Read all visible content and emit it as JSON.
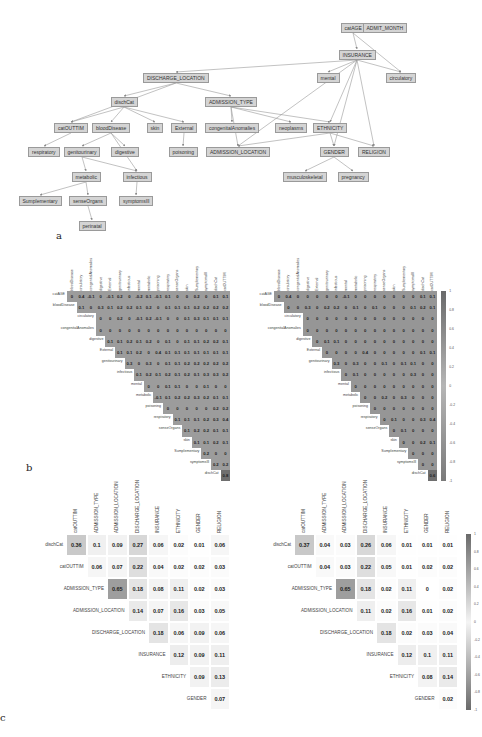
{
  "panels": {
    "a": "a",
    "b": "b",
    "c": "c"
  },
  "graph": {
    "nodes": [
      {
        "id": "catAGE",
        "x": 353,
        "y": 28
      },
      {
        "id": "ADMIT_MONTH",
        "x": 385,
        "y": 28
      },
      {
        "id": "INSURANCE",
        "x": 357,
        "y": 55
      },
      {
        "id": "DISCHARGE_LOCATION",
        "x": 176,
        "y": 78
      },
      {
        "id": "mental",
        "x": 328,
        "y": 78
      },
      {
        "id": "circulatory",
        "x": 401,
        "y": 78
      },
      {
        "id": "dischCat",
        "x": 124,
        "y": 102
      },
      {
        "id": "ADMISSION_TYPE",
        "x": 231,
        "y": 102
      },
      {
        "id": "catOUTTIM",
        "x": 71,
        "y": 128
      },
      {
        "id": "bloodDisease",
        "x": 111,
        "y": 128
      },
      {
        "id": "skin",
        "x": 155,
        "y": 128
      },
      {
        "id": "External",
        "x": 184,
        "y": 128
      },
      {
        "id": "congenitalAnomalies",
        "x": 232,
        "y": 128
      },
      {
        "id": "neoplasms",
        "x": 291,
        "y": 128
      },
      {
        "id": "ETHNICITY",
        "x": 330,
        "y": 128
      },
      {
        "id": "respiratory",
        "x": 44,
        "y": 152
      },
      {
        "id": "genitourinary",
        "x": 82,
        "y": 152
      },
      {
        "id": "digestive",
        "x": 125,
        "y": 152
      },
      {
        "id": "poisoning",
        "x": 183,
        "y": 152
      },
      {
        "id": "ADMISSION_LOCATION",
        "x": 238,
        "y": 152
      },
      {
        "id": "GENDER",
        "x": 334,
        "y": 152
      },
      {
        "id": "RELIGION",
        "x": 374,
        "y": 152
      },
      {
        "id": "metabolic",
        "x": 86,
        "y": 177
      },
      {
        "id": "infectious",
        "x": 137,
        "y": 177
      },
      {
        "id": "musculoskeletal",
        "x": 305,
        "y": 177
      },
      {
        "id": "pregnancy",
        "x": 353,
        "y": 177
      },
      {
        "id": "Sumplementary",
        "x": 40,
        "y": 201
      },
      {
        "id": "senseOrgans",
        "x": 88,
        "y": 201
      },
      {
        "id": "symptomsIll",
        "x": 136,
        "y": 201
      },
      {
        "id": "perinatal",
        "x": 92,
        "y": 226
      }
    ],
    "edges": [
      [
        "catAGE",
        "INSURANCE"
      ],
      [
        "catAGE",
        "circulatory"
      ],
      [
        "INSURANCE",
        "DISCHARGE_LOCATION"
      ],
      [
        "INSURANCE",
        "mental"
      ],
      [
        "INSURANCE",
        "circulatory"
      ],
      [
        "INSURANCE",
        "ETHNICITY"
      ],
      [
        "INSURANCE",
        "GENDER"
      ],
      [
        "INSURANCE",
        "RELIGION"
      ],
      [
        "INSURANCE",
        "ADMISSION_LOCATION"
      ],
      [
        "DISCHARGE_LOCATION",
        "dischCat"
      ],
      [
        "DISCHARGE_LOCATION",
        "ADMISSION_TYPE"
      ],
      [
        "DISCHARGE_LOCATION",
        "catOUTTIM"
      ],
      [
        "dischCat",
        "catOUTTIM"
      ],
      [
        "dischCat",
        "bloodDisease"
      ],
      [
        "dischCat",
        "skin"
      ],
      [
        "dischCat",
        "External"
      ],
      [
        "ADMISSION_TYPE",
        "congenitalAnomalies"
      ],
      [
        "ADMISSION_TYPE",
        "neoplasms"
      ],
      [
        "ADMISSION_TYPE",
        "ETHNICITY"
      ],
      [
        "ADMISSION_TYPE",
        "ADMISSION_LOCATION"
      ],
      [
        "catOUTTIM",
        "respiratory"
      ],
      [
        "bloodDisease",
        "genitourinary"
      ],
      [
        "bloodDisease",
        "digestive"
      ],
      [
        "bloodDisease",
        "infectious"
      ],
      [
        "External",
        "poisoning"
      ],
      [
        "ETHNICITY",
        "ADMISSION_LOCATION"
      ],
      [
        "ETHNICITY",
        "GENDER"
      ],
      [
        "ETHNICITY",
        "RELIGION"
      ],
      [
        "genitourinary",
        "metabolic"
      ],
      [
        "genitourinary",
        "infectious"
      ],
      [
        "metabolic",
        "Sumplementary"
      ],
      [
        "metabolic",
        "senseOrgans"
      ],
      [
        "infectious",
        "symptomsIll"
      ],
      [
        "senseOrgans",
        "perinatal"
      ],
      [
        "GENDER",
        "musculoskeletal"
      ],
      [
        "GENDER",
        "pregnancy"
      ]
    ]
  },
  "chart_data": [
    {
      "type": "heatmap",
      "title": "Panel b (left): correlation matrix of clinical variables",
      "columns": [
        "bloodDisease",
        "circulatory",
        "congenitalAnomalies",
        "digestive",
        "External",
        "genitourinary",
        "infectious",
        "mental",
        "metabolic",
        "poisoning",
        "respiratory",
        "senseOrgans",
        "skin",
        "Sumplementary",
        "symptomsIll",
        "dischCat",
        "catOUTTIM"
      ],
      "rows": [
        {
          "label": "catAGE",
          "values": [
            "0",
            "0.4",
            "-0.1",
            "0",
            "-0.1",
            "0.2",
            "0",
            "-0.2",
            "0.1",
            "-0.1",
            "0.1",
            "0",
            "0",
            "0.2",
            "0",
            "0.1",
            "0.1"
          ]
        },
        {
          "label": "bloodDisease",
          "values": [
            "0.1",
            "0",
            "0.3",
            "0.1",
            "0.2",
            "0.2",
            "0.1",
            "0.2",
            "0",
            "0.1",
            "0.1",
            "0.1",
            "0.2",
            "0.2",
            "0.2",
            "0.2"
          ]
        },
        {
          "label": "circulatory",
          "values": [
            "0",
            "0",
            "0.2",
            "0",
            "-0.1",
            "0.2",
            "-0.1",
            "0",
            "0",
            "0.1",
            "0.3",
            "0.1",
            "0.1",
            "0.1"
          ]
        },
        {
          "label": "congenitalAnomalies",
          "values": [
            "0",
            "0",
            "0",
            "0",
            "0",
            "0",
            "0",
            "0",
            "0",
            "0",
            "0",
            "0",
            "0",
            "0"
          ]
        },
        {
          "label": "digestive",
          "values": [
            "0.1",
            "0.1",
            "0.2",
            "0.1",
            "0.2",
            "0",
            "0.1",
            "0",
            "0.1",
            "0.1",
            "0.2",
            "0.2",
            "0.1"
          ]
        },
        {
          "label": "External",
          "values": [
            "0.1",
            "0.1",
            "0.2",
            "0",
            "0.4",
            "0.1",
            "0.1",
            "0.1",
            "0.1",
            "0.1",
            "0.1",
            "0.1"
          ]
        },
        {
          "label": "genitourinary",
          "values": [
            "0.3",
            "0",
            "0.3",
            "0",
            "0.1",
            "0.1",
            "0.2",
            "0.2",
            "0.2",
            "0.2",
            "0.2"
          ]
        },
        {
          "label": "infectious",
          "values": [
            "0.1",
            "0.2",
            "0.1",
            "0.2",
            "0.1",
            "0.2",
            "0.1",
            "0.3",
            "0.3",
            "0.2"
          ]
        },
        {
          "label": "mental",
          "values": [
            "0",
            "0",
            "0.1",
            "0.1",
            "0",
            "0",
            "0.1",
            "0",
            "0"
          ]
        },
        {
          "label": "metabolic",
          "values": [
            "-0.1",
            "0.1",
            "0.2",
            "0.2",
            "0.3",
            "0.2",
            "0.1",
            "0.1"
          ]
        },
        {
          "label": "poisoning",
          "values": [
            "0",
            "0",
            "0",
            "0",
            "0",
            "0.2",
            "0.2"
          ]
        },
        {
          "label": "respiratory",
          "values": [
            "0.1",
            "0.1",
            "0.1",
            "0.2",
            "0.3",
            "0.4"
          ]
        },
        {
          "label": "senseOrgans",
          "values": [
            "0.1",
            "0.2",
            "0.2",
            "0.1",
            "0.1"
          ]
        },
        {
          "label": "skin",
          "values": [
            "0.1",
            "0.1",
            "0.2",
            "0.1"
          ]
        },
        {
          "label": "Sumplementary",
          "values": [
            "0.2",
            "0",
            "0"
          ]
        },
        {
          "label": "symptomsIll",
          "values": [
            "0.2",
            "0.2"
          ]
        },
        {
          "label": "dischCat",
          "values": [
            "0.8"
          ]
        }
      ]
    },
    {
      "type": "heatmap",
      "title": "Panel b (right): correlation matrix of clinical variables",
      "columns": [
        "bloodDisease",
        "circulatory",
        "congenitalAnomalies",
        "digestive",
        "External",
        "genitourinary",
        "infectious",
        "mental",
        "metabolic",
        "poisoning",
        "respiratory",
        "senseOrgans",
        "skin",
        "Sumplementary",
        "symptomsIll",
        "dischCat",
        "catOUTTIM"
      ],
      "rows": [
        {
          "label": "catAGE",
          "values": [
            "0",
            "0.4",
            "0",
            "0",
            "0",
            "0",
            "0",
            "-0.1",
            "0",
            "0",
            "0",
            "0",
            "0",
            "0",
            "0",
            "0.1",
            "0.1"
          ]
        },
        {
          "label": "bloodDisease",
          "values": [
            "0",
            "0",
            "0.3",
            "0",
            "0.2",
            "0.2",
            "0",
            "0.1",
            "0",
            "0.1",
            "0",
            "0",
            "0",
            "0.1",
            "0.2",
            "0.1"
          ]
        },
        {
          "label": "circulatory",
          "values": [
            "0",
            "0",
            "0",
            "0",
            "0",
            "0",
            "0",
            "0",
            "0",
            "0",
            "0",
            "0",
            "0",
            "0"
          ]
        },
        {
          "label": "congenitalAnomalies",
          "values": [
            "0",
            "0",
            "0",
            "0",
            "0",
            "0",
            "0",
            "0",
            "0",
            "0",
            "0",
            "0",
            "0",
            "0"
          ]
        },
        {
          "label": "digestive",
          "values": [
            "0",
            "0.1",
            "0.1",
            "0",
            "0",
            "0",
            "0",
            "0",
            "0",
            "0",
            "0",
            "0",
            "0"
          ]
        },
        {
          "label": "External",
          "values": [
            "0",
            "0",
            "0",
            "0",
            "0.4",
            "0",
            "0",
            "0",
            "0",
            "0",
            "0.1",
            "0.1"
          ]
        },
        {
          "label": "genitourinary",
          "values": [
            "0.3",
            "0",
            "0.3",
            "0",
            "0",
            "0.1",
            "0",
            "0.1",
            "0.1",
            "0",
            "0"
          ]
        },
        {
          "label": "infectious",
          "values": [
            "0",
            "0.1",
            "0",
            "0",
            "0",
            "0",
            "0",
            "0.3",
            "0",
            "0"
          ]
        },
        {
          "label": "mental",
          "values": [
            "0",
            "0",
            "0",
            "0",
            "0",
            "0",
            "0",
            "0",
            "0"
          ]
        },
        {
          "label": "metabolic",
          "values": [
            "0",
            "0",
            "0.2",
            "0",
            "0.3",
            "0",
            "0",
            "0"
          ]
        },
        {
          "label": "poisoning",
          "values": [
            "0",
            "0",
            "0",
            "0",
            "0",
            "0",
            "0"
          ]
        },
        {
          "label": "respiratory",
          "values": [
            "0",
            "0.1",
            "0",
            "0",
            "0.3",
            "0.4"
          ]
        },
        {
          "label": "senseOrgans",
          "values": [
            "0",
            "0.1",
            "0",
            "0",
            "0"
          ]
        },
        {
          "label": "skin",
          "values": [
            "0",
            "0",
            "0.2",
            "0.1"
          ]
        },
        {
          "label": "Sumplementary",
          "values": [
            "0",
            "0",
            "0"
          ]
        },
        {
          "label": "symptomsIll",
          "values": [
            "0",
            "0"
          ]
        },
        {
          "label": "dischCat",
          "values": [
            "0.6"
          ]
        }
      ],
      "colorbar": {
        "ticks": [
          "1",
          "0.8",
          "0.6",
          "0.4",
          "0.2",
          "0",
          "-0.2",
          "-0.4",
          "-0.6",
          "-0.8",
          "-1"
        ]
      }
    },
    {
      "type": "heatmap",
      "title": "Panel c (left): association matrix of admission variables",
      "columns": [
        "catOUTTIM",
        "ADMISSION_TYPE",
        "ADMISSION_LOCATION",
        "DISCHARGE_LOCATION",
        "INSURANCE",
        "ETHNICITY",
        "GENDER",
        "RELIGION"
      ],
      "rows": [
        {
          "label": "dischCat",
          "values": [
            "0.36",
            "0.1",
            "0.09",
            "0.27",
            "0.06",
            "0.02",
            "0.01",
            "0.06"
          ]
        },
        {
          "label": "catOUTTIM",
          "values": [
            "0.06",
            "0.07",
            "0.22",
            "0.04",
            "0.02",
            "0.02",
            "0.03"
          ]
        },
        {
          "label": "ADMISSION_TYPE",
          "values": [
            "0.65",
            "0.18",
            "0.08",
            "0.11",
            "0.02",
            "0.03"
          ]
        },
        {
          "label": "ADMISSION_LOCATION",
          "values": [
            "0.14",
            "0.07",
            "0.16",
            "0.03",
            "0.05"
          ]
        },
        {
          "label": "DISCHARGE_LOCATION",
          "values": [
            "0.18",
            "0.06",
            "0.09",
            "0.06"
          ]
        },
        {
          "label": "INSURANCE",
          "values": [
            "0.12",
            "0.09",
            "0.11"
          ]
        },
        {
          "label": "ETHNICITY",
          "values": [
            "0.09",
            "0.13"
          ]
        },
        {
          "label": "GENDER",
          "values": [
            "0.07"
          ]
        }
      ]
    },
    {
      "type": "heatmap",
      "title": "Panel c (right): association matrix of admission variables",
      "columns": [
        "catOUTTIM",
        "ADMISSION_TYPE",
        "ADMISSION_LOCATION",
        "DISCHARGE_LOCATION",
        "INSURANCE",
        "ETHNICITY",
        "GENDER",
        "RELIGION"
      ],
      "rows": [
        {
          "label": "dischCat",
          "values": [
            "0.37",
            "0.04",
            "0.03",
            "0.26",
            "0.06",
            "0.01",
            "0.01",
            "0.01"
          ]
        },
        {
          "label": "catOUTTIM",
          "values": [
            "0.04",
            "0.03",
            "0.22",
            "0.05",
            "0.01",
            "0.02",
            "0.02"
          ]
        },
        {
          "label": "ADMISSION_TYPE",
          "values": [
            "0.65",
            "0.18",
            "0.02",
            "0.11",
            "0",
            "0.02"
          ]
        },
        {
          "label": "ADMISSION_LOCATION",
          "values": [
            "0.11",
            "0.02",
            "0.16",
            "0.01",
            "0.02"
          ]
        },
        {
          "label": "DISCHARGE_LOCATION",
          "values": [
            "0.18",
            "0.02",
            "0.03",
            "0.04"
          ]
        },
        {
          "label": "INSURANCE",
          "values": [
            "0.12",
            "0.1",
            "0.11"
          ]
        },
        {
          "label": "ETHNICITY",
          "values": [
            "0.08",
            "0.14"
          ]
        },
        {
          "label": "GENDER",
          "values": [
            "0.02"
          ]
        }
      ],
      "colorbar": {
        "ticks": [
          "1",
          "0.8",
          "0.6",
          "0.4",
          "0.2",
          "0",
          "-0.2",
          "-0.4",
          "-0.6",
          "-0.8",
          "-1"
        ]
      }
    }
  ]
}
